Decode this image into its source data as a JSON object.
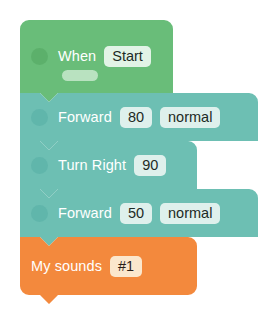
{
  "canvas": {
    "background": "#ffffff",
    "title": "Block program script"
  },
  "palette": {
    "event_green": "#69bd79",
    "motion_teal": "#6dbfb3",
    "sound_orange": "#f3893d",
    "chip_mint": "#e2f3e6",
    "chip_mint_teal": "#def0ec",
    "chip_cream": "#fbe7cd",
    "label_text": "#ffffff",
    "chip_text": "#20303a"
  },
  "script": {
    "blocks": [
      {
        "id": "when-start",
        "kind": "hat",
        "category": "event",
        "label": "When",
        "fields": [
          {
            "name": "trigger",
            "value": "Start",
            "style": "mint"
          }
        ],
        "has_grip": true,
        "has_inner_pill": true
      },
      {
        "id": "forward-80",
        "kind": "stack",
        "category": "motion",
        "label": "Forward",
        "fields": [
          {
            "name": "distance",
            "value": "80",
            "style": "mint-t"
          },
          {
            "name": "speed",
            "value": "normal",
            "style": "mint-t"
          }
        ],
        "has_grip": true,
        "has_inner_pill": false
      },
      {
        "id": "turn-right-90",
        "kind": "stack",
        "category": "motion",
        "label": "Turn Right",
        "fields": [
          {
            "name": "angle",
            "value": "90",
            "style": "mint-t"
          }
        ],
        "has_grip": true,
        "has_inner_pill": false
      },
      {
        "id": "forward-50",
        "kind": "stack",
        "category": "motion",
        "label": "Forward",
        "fields": [
          {
            "name": "distance",
            "value": "50",
            "style": "mint-t"
          },
          {
            "name": "speed",
            "value": "normal",
            "style": "mint-t"
          }
        ],
        "has_grip": true,
        "has_inner_pill": false
      },
      {
        "id": "my-sounds-1",
        "kind": "stack-end",
        "category": "sound",
        "label": "My sounds",
        "fields": [
          {
            "name": "sound",
            "value": "#1",
            "style": "cream"
          }
        ],
        "has_grip": false,
        "has_inner_pill": false
      }
    ]
  }
}
